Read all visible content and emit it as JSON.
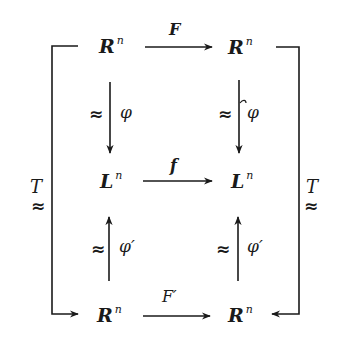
{
  "diagram": {
    "type": "commutative-diagram",
    "nodes": {
      "top_left": {
        "base": "R",
        "sup": "n"
      },
      "top_right": {
        "base": "R",
        "sup": "n"
      },
      "mid_left": {
        "base": "L",
        "sup": "n"
      },
      "mid_right": {
        "base": "L",
        "sup": "n"
      },
      "bot_left": {
        "base": "R",
        "sup": "n"
      },
      "bot_right": {
        "base": "R",
        "sup": "n"
      }
    },
    "arrows": {
      "top": {
        "label": "F",
        "from": "top_left",
        "to": "top_right"
      },
      "middle": {
        "label": "f",
        "from": "mid_left",
        "to": "mid_right"
      },
      "bottom": {
        "label": "F′",
        "from": "bot_left",
        "to": "bot_right"
      },
      "left_down": {
        "label": "φ",
        "iso": "≈",
        "from": "top_left",
        "to": "mid_left"
      },
      "right_down": {
        "label": "φ",
        "iso": "≈",
        "from": "top_right",
        "to": "mid_right"
      },
      "left_up": {
        "label": "φ′",
        "iso": "≈",
        "from": "bot_left",
        "to": "mid_left"
      },
      "right_up": {
        "label": "φ′",
        "iso": "≈",
        "from": "bot_right",
        "to": "mid_right"
      },
      "outer_left": {
        "label": "T",
        "iso": "≈",
        "from": "top_left",
        "to": "bot_left"
      },
      "outer_right": {
        "label": "T",
        "iso": "≈",
        "from": "top_right",
        "to": "bot_right"
      }
    },
    "colors": {
      "ink": "#1a1a1a",
      "background": "#ffffff"
    }
  }
}
